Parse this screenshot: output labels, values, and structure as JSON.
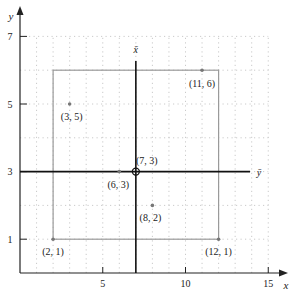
{
  "diagram": {
    "type": "coordinate-plane-with-points",
    "axes": {
      "x_label": "x",
      "y_label": "y",
      "x_ticks": [
        {
          "value": 5,
          "label": "5"
        },
        {
          "value": 10,
          "label": "10"
        },
        {
          "value": 15,
          "label": "15"
        }
      ],
      "y_ticks": [
        {
          "value": 1,
          "label": "1"
        },
        {
          "value": 3,
          "label": "3"
        },
        {
          "value": 5,
          "label": "5"
        },
        {
          "value": 7,
          "label": "7"
        }
      ],
      "x_range": [
        0,
        15.8
      ],
      "y_range": [
        0,
        7.6
      ]
    },
    "grid": {
      "visible": true,
      "style": "dotted",
      "x_step": 1,
      "y_step": 1
    },
    "mean_axes": {
      "x_bar_label": "x̄",
      "y_bar_label": "ȳ",
      "x_bar_value": 7,
      "y_bar_value": 3
    },
    "bounding_box": {
      "x_min": 2,
      "x_max": 12,
      "y_min": 1,
      "y_max": 6
    },
    "points": [
      {
        "x": 2,
        "y": 1,
        "label": "(2, 1)"
      },
      {
        "x": 3,
        "y": 5,
        "label": "(3, 5)"
      },
      {
        "x": 6,
        "y": 3,
        "label": "(6, 3)"
      },
      {
        "x": 8,
        "y": 2,
        "label": "(8, 2)"
      },
      {
        "x": 11,
        "y": 6,
        "label": "(11, 6)"
      },
      {
        "x": 12,
        "y": 1,
        "label": "(12, 1)"
      }
    ],
    "centroid": {
      "x": 7,
      "y": 3,
      "label": "(7, 3)"
    },
    "colors": {
      "axis": "#222222",
      "mean_lines": "#111111",
      "box": "#9a9a9a",
      "grid": "#bdbdbd",
      "points": "#777777"
    }
  }
}
